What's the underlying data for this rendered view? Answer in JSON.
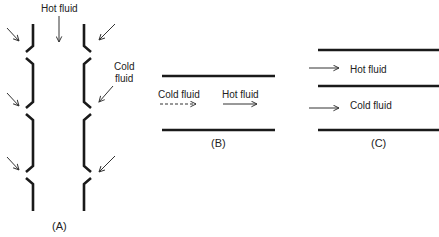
{
  "diagram": {
    "panels": [
      {
        "id": "A",
        "caption": "(A)",
        "description": "Vertical duct with hot fluid flowing downward; cold fluid injected through slots in both walls at three stations (film cooling)",
        "labels": {
          "hot": "Hot fluid",
          "cold_line1": "Cold",
          "cold_line2": "fluid"
        },
        "injection_stations": 3
      },
      {
        "id": "B",
        "caption": "(B)",
        "description": "Single channel with cold fluid (dashed arrow) and hot fluid (solid arrow) flowing in same direction",
        "labels": {
          "cold": "Cold fluid",
          "hot": "Hot fluid"
        }
      },
      {
        "id": "C",
        "caption": "(C)",
        "description": "Two parallel channels separated by a wall: hot fluid on top, cold fluid on bottom, both flowing right",
        "labels": {
          "hot": "Hot fluid",
          "cold": "Cold fluid"
        }
      }
    ],
    "colors": {
      "line": "#1a1a1a",
      "text": "#222222",
      "background": "#ffffff"
    }
  }
}
